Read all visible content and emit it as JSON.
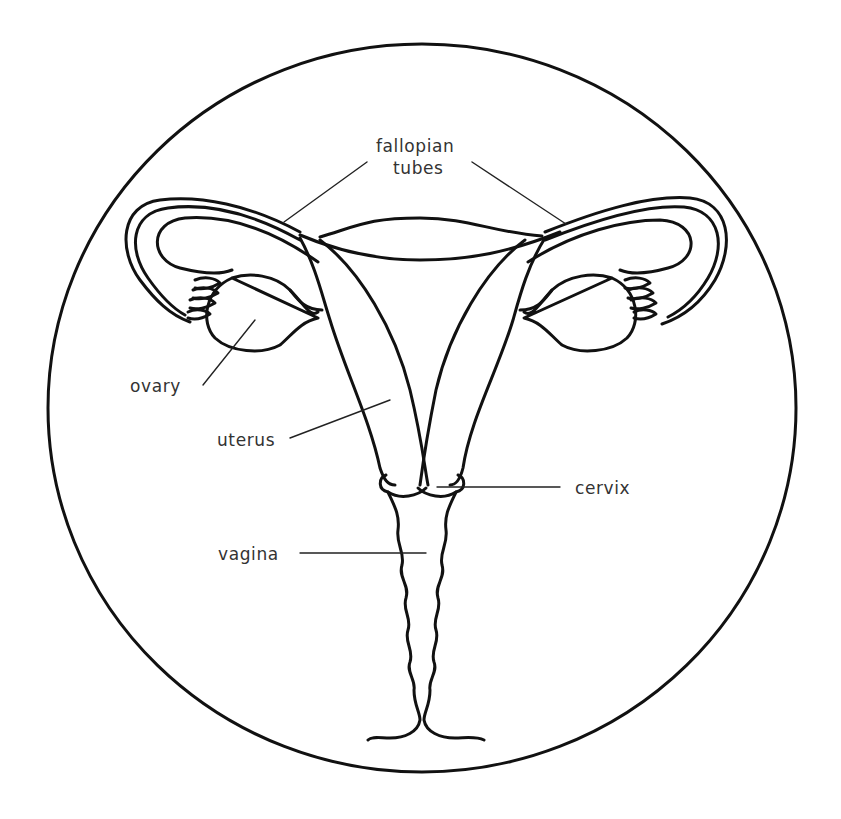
{
  "colors": {
    "background": "#ffffff",
    "stroke": "#111111",
    "label_text": "#333333"
  },
  "labels": {
    "fallopian_tubes_line1": "fallopian",
    "fallopian_tubes_line2": "tubes",
    "ovary": "ovary",
    "uterus": "uterus",
    "cervix": "cervix",
    "vagina": "vagina"
  },
  "structures": [
    "circle-frame",
    "fallopian-tube-left",
    "fallopian-tube-right",
    "ovary-left",
    "ovary-right",
    "uterus",
    "cervix",
    "vagina"
  ]
}
